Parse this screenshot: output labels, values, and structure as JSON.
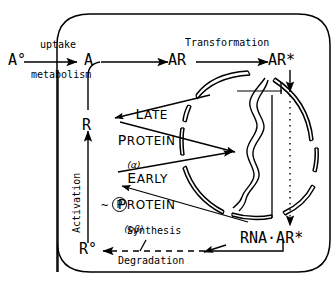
{
  "figure": {
    "type": "biological-pathway-diagram",
    "title": "",
    "background_color": "#ffffff",
    "stroke_color": "#000000"
  },
  "nodes": {
    "a_extracellular": "A°",
    "a_intracellular": "A",
    "ar": "AR",
    "ar_star": "AR*",
    "rna_ar_star": "RNA·AR*",
    "r": "R",
    "r_zero": "R°",
    "phosphate": "P",
    "phosphate_bond": "~"
  },
  "edges": {
    "uptake": "uptake",
    "metabolism": "metabolism",
    "transformation": "Transformation",
    "activation": "Activation",
    "synthesis": "Synthesis",
    "degradation": "Degradation"
  },
  "products": {
    "late": {
      "line1": "L",
      "line1_rest": "ATE",
      "line2": "P",
      "line2_rest": "ROTEIN",
      "gene": "(α)"
    },
    "early": {
      "line1": "E",
      "line1_rest": "ARLY",
      "line2": "P",
      "line2_rest": "ROTEIN",
      "gene": "(pβ)"
    }
  },
  "cell": {
    "membrane_shape": "rounded-rectangle",
    "nucleus_shape": "segmented-circle",
    "genome_shape": "double-helix"
  }
}
